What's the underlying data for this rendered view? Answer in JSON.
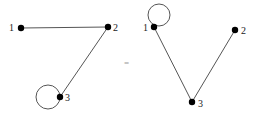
{
  "diagram": {
    "relation_symbol": "=",
    "left_graph": {
      "nodes": [
        {
          "id": "1",
          "label": "1",
          "x": 21,
          "y": 28
        },
        {
          "id": "2",
          "label": "2",
          "x": 108,
          "y": 27
        },
        {
          "id": "3",
          "label": "3",
          "x": 60,
          "y": 97
        }
      ],
      "edges": [
        {
          "from": "1",
          "to": "2"
        },
        {
          "from": "2",
          "to": "3"
        }
      ],
      "loops": [
        {
          "node": "3",
          "cx": 48,
          "cy": 97,
          "r": 12
        }
      ]
    },
    "right_graph": {
      "nodes": [
        {
          "id": "1",
          "label": "1",
          "x": 154,
          "y": 27
        },
        {
          "id": "2",
          "label": "2",
          "x": 235,
          "y": 30
        },
        {
          "id": "3",
          "label": "3",
          "x": 192,
          "y": 102
        }
      ],
      "edges": [
        {
          "from": "1",
          "to": "3"
        },
        {
          "from": "2",
          "to": "3"
        }
      ],
      "loops": [
        {
          "node": "1",
          "cx": 159,
          "cy": 15,
          "r": 11
        }
      ]
    },
    "colors": {
      "node": "#000000",
      "edge": "#555555",
      "label": "#222222"
    }
  }
}
